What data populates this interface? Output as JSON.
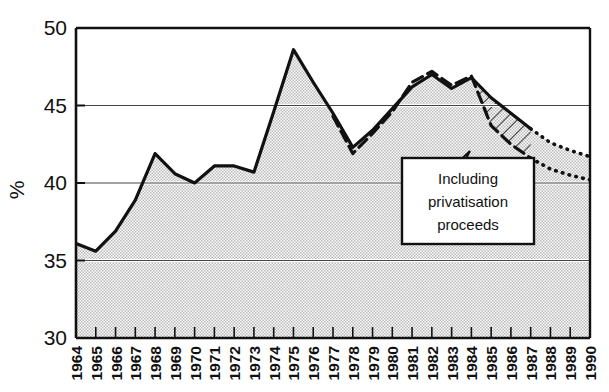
{
  "chart_data": {
    "type": "area",
    "title": "",
    "subtitle": "",
    "xlabel": "",
    "ylabel": "%",
    "ylim": [
      30,
      50
    ],
    "ytick_values": [
      30,
      35,
      40,
      45,
      50
    ],
    "ytick_labels": [
      "30",
      "35",
      "40",
      "45",
      "50"
    ],
    "grid": true,
    "grid_y_values": [
      35,
      40,
      45
    ],
    "grid_x_years": [
      1968,
      1973,
      1978,
      1983,
      1988
    ],
    "legend_position": "none",
    "categories": [
      "1964",
      "1965",
      "1966",
      "1967",
      "1968",
      "1969",
      "1970",
      "1971",
      "1972",
      "1973",
      "1974",
      "1975",
      "1976",
      "1977",
      "1978",
      "1979",
      "1980",
      "1981",
      "1982",
      "1983",
      "1984",
      "1985",
      "1986",
      "1987",
      "1988",
      "1989",
      "1990"
    ],
    "series": [
      {
        "name": "Including privatisation proceeds",
        "style": "solid-filled",
        "values": [
          36.1,
          35.6,
          36.9,
          38.9,
          41.9,
          40.6,
          40.0,
          41.1,
          41.1,
          40.7,
          44.6,
          48.6,
          46.5,
          44.5,
          42.3,
          43.4,
          44.8,
          46.2,
          47.0,
          46.1,
          46.8,
          45.5,
          44.5,
          43.5,
          42.6,
          42.1,
          41.7
        ],
        "dotted_from_year": "1987"
      },
      {
        "name": "Excluding privatisation proceeds",
        "style": "dashed",
        "values": [
          null,
          null,
          null,
          null,
          null,
          null,
          null,
          null,
          null,
          null,
          null,
          null,
          null,
          44.3,
          41.9,
          43.2,
          44.6,
          46.5,
          47.2,
          46.3,
          46.9,
          43.7,
          42.5,
          41.6,
          40.9,
          40.5,
          40.2
        ],
        "dotted_from_year": "1987"
      }
    ],
    "annotations": [
      {
        "name": "privatisation-callout",
        "text_lines": [
          "Including",
          "privatisation",
          "proceeds"
        ],
        "full_text": "Including privatisation proceeds",
        "pointer_target_year": "1985",
        "pointer_target_value": 45.4
      }
    ],
    "hatched_region": {
      "name": "privatisation-proceeds-hatch",
      "description": "Hatched band between the two curves, 1984-1987"
    },
    "colors": {
      "line": "#111111",
      "fill": "#d8d8d8",
      "grid": "#ffffff",
      "axis": "#111111",
      "background": "#ffffff",
      "callout_bg": "#ffffff"
    }
  }
}
